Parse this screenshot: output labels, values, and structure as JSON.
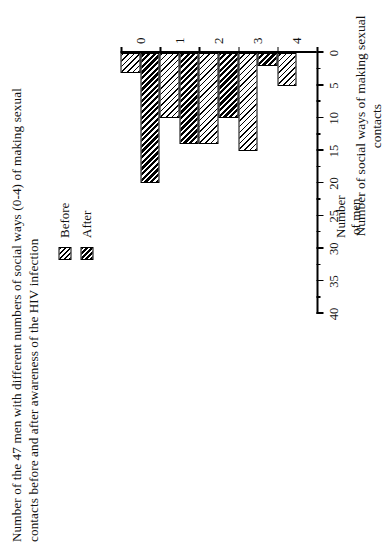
{
  "figure": {
    "title": "Number of the 47 men with different numbers of social ways (0-4) of making sexual contacts before and after awareness of the HIV infection",
    "orientation": "rotated-90-ccw",
    "background": "#ffffff",
    "ink": "#000000"
  },
  "legend": {
    "position": "top-right",
    "entries": [
      {
        "label": "Before",
        "swatch": "light-diagonal-hatch"
      },
      {
        "label": "After",
        "swatch": "dense-diagonal-hatch"
      }
    ]
  },
  "axes": {
    "value_axis_label_line1": "Number",
    "value_axis_label_line2": "of men",
    "category_axis_label": "Number of social ways of making sexual contacts",
    "value_ticks": [
      "0",
      "5",
      "10",
      "15",
      "20",
      "25",
      "30",
      "35",
      "40"
    ],
    "category_ticks": [
      "0",
      "1",
      "2",
      "3",
      "4"
    ]
  },
  "chart_data": {
    "type": "bar",
    "title": "Number of the 47 men with different numbers of social ways (0-4) of making sexual contacts before and after awareness of the HIV infection",
    "orientation": "horizontal",
    "categories": [
      "0",
      "1",
      "2",
      "3",
      "4"
    ],
    "series": [
      {
        "name": "Before",
        "values": [
          3,
          10,
          14,
          15,
          5
        ]
      },
      {
        "name": "After",
        "values": [
          20,
          14,
          10,
          2,
          0
        ]
      }
    ],
    "xlabel": "Number of social ways of making sexual contacts",
    "ylabel": "Number of men",
    "ylim": [
      0,
      40
    ],
    "tick_step": 5,
    "minor_tick_step": 2.5,
    "grid": false,
    "legend_position": "top-right",
    "total_subjects": 47
  }
}
